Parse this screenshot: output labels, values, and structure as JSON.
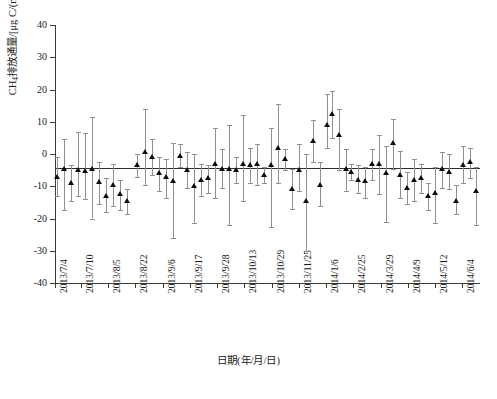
{
  "chart_data": {
    "type": "scatter",
    "title": "",
    "xlabel": "日期(年/月/日)",
    "ylabel": "CH4排放通量/[μg C/(m2 · h)]",
    "ylabel_parts": {
      "prefix": "CH",
      "sub1": "4",
      "mid": "排放通量/[μg C/(m",
      "sup1": "2",
      "suffix": " · h)]"
    },
    "ylim": [
      -40,
      40
    ],
    "yticks": [
      40,
      30,
      20,
      10,
      0,
      -10,
      -20,
      -30,
      -40
    ],
    "ytick_labels": [
      "40",
      "30",
      "20",
      "10",
      "0",
      "-10",
      "-20",
      "-30",
      "-40"
    ],
    "grid": false,
    "legend": "none",
    "marker_style": "filled-triangle",
    "error_bars": "vertical with caps",
    "reference_line": {
      "label": "mean flux",
      "value": -4.3,
      "orientation": "horizontal"
    },
    "xtick_labels": [
      "2013/7/4",
      "2013/7/10",
      "2013/8/5",
      "2013/8/22",
      "2013/9/6",
      "2013/9/17",
      "2013/9/28",
      "2013/10/13",
      "2013/10/29",
      "2013/11/25",
      "2014/1/6",
      "2014/2/25",
      "2014/3/29",
      "2014/4/9",
      "2014/5/12",
      "2014/6/4"
    ],
    "xtick_positions": [
      0,
      26,
      53,
      80,
      108,
      135,
      162,
      189,
      217,
      244,
      271,
      298,
      326,
      353,
      380,
      407
    ],
    "units": "μg C/(m2 · h)",
    "series": [
      {
        "name": "CH4 flux",
        "points": [
          {
            "x": 2,
            "y": -7.0,
            "lo": -13.0,
            "hi": -1.0
          },
          {
            "x": 9,
            "y": -4.6,
            "lo": -17.5,
            "hi": 4.5
          },
          {
            "x": 16,
            "y": -9.0,
            "lo": -14.5,
            "hi": -3.5
          },
          {
            "x": 23,
            "y": -5.0,
            "lo": -13.0,
            "hi": 6.8
          },
          {
            "x": 30,
            "y": -5.2,
            "lo": -14.0,
            "hi": 6.5
          },
          {
            "x": 37,
            "y": -4.5,
            "lo": -20.0,
            "hi": 11.5
          },
          {
            "x": 44,
            "y": -8.8,
            "lo": -15.5,
            "hi": -2.5
          },
          {
            "x": 51,
            "y": -13.0,
            "lo": -18.0,
            "hi": -7.5
          },
          {
            "x": 58,
            "y": -9.5,
            "lo": -16.0,
            "hi": -3.0
          },
          {
            "x": 65,
            "y": -12.5,
            "lo": -17.5,
            "hi": -8.0
          },
          {
            "x": 72,
            "y": -14.5,
            "lo": -18.5,
            "hi": -11.0
          },
          {
            "x": 82,
            "y": -3.5,
            "lo": -7.0,
            "hi": 0.0
          },
          {
            "x": 90,
            "y": 0.5,
            "lo": -9.5,
            "hi": 14.0
          },
          {
            "x": 97,
            "y": -1.0,
            "lo": -6.5,
            "hi": 4.5
          },
          {
            "x": 104,
            "y": -6.0,
            "lo": -11.5,
            "hi": -1.0
          },
          {
            "x": 111,
            "y": -7.0,
            "lo": -13.5,
            "hi": -1.5
          },
          {
            "x": 118,
            "y": -8.5,
            "lo": -26.0,
            "hi": 3.5
          },
          {
            "x": 125,
            "y": -0.5,
            "lo": -4.0,
            "hi": 3.0
          },
          {
            "x": 132,
            "y": -5.0,
            "lo": -10.5,
            "hi": 0.5
          },
          {
            "x": 139,
            "y": -10.0,
            "lo": -21.5,
            "hi": 0.0
          },
          {
            "x": 146,
            "y": -8.0,
            "lo": -13.0,
            "hi": -3.0
          },
          {
            "x": 153,
            "y": -7.5,
            "lo": -12.0,
            "hi": -3.5
          },
          {
            "x": 160,
            "y": -3.0,
            "lo": -13.5,
            "hi": 8.0
          },
          {
            "x": 167,
            "y": -4.5,
            "lo": -10.5,
            "hi": 1.5
          },
          {
            "x": 174,
            "y": -4.5,
            "lo": -22.0,
            "hi": 9.0
          },
          {
            "x": 181,
            "y": -5.0,
            "lo": -9.0,
            "hi": -1.0
          },
          {
            "x": 188,
            "y": -3.0,
            "lo": -14.5,
            "hi": 12.0
          },
          {
            "x": 195,
            "y": -3.5,
            "lo": -9.0,
            "hi": 2.0
          },
          {
            "x": 202,
            "y": -3.0,
            "lo": -9.5,
            "hi": 3.0
          },
          {
            "x": 209,
            "y": -6.5,
            "lo": -9.0,
            "hi": -4.0
          },
          {
            "x": 216,
            "y": -3.5,
            "lo": -22.5,
            "hi": 8.0
          },
          {
            "x": 223,
            "y": 2.0,
            "lo": -9.0,
            "hi": 15.5
          },
          {
            "x": 230,
            "y": -1.5,
            "lo": -5.0,
            "hi": 1.5
          },
          {
            "x": 237,
            "y": -11.0,
            "lo": -17.0,
            "hi": -4.5
          },
          {
            "x": 244,
            "y": -5.0,
            "lo": -11.5,
            "hi": 3.0
          },
          {
            "x": 251,
            "y": -14.5,
            "lo": -30.0,
            "hi": 0.0
          },
          {
            "x": 258,
            "y": 4.0,
            "lo": -2.5,
            "hi": 10.5
          },
          {
            "x": 265,
            "y": -9.5,
            "lo": -16.0,
            "hi": -2.5
          },
          {
            "x": 272,
            "y": 9.0,
            "lo": 2.0,
            "hi": 18.5
          },
          {
            "x": 277,
            "y": 12.5,
            "lo": 5.0,
            "hi": 19.5
          },
          {
            "x": 284,
            "y": 6.0,
            "lo": -5.0,
            "hi": 14.0
          },
          {
            "x": 291,
            "y": -4.5,
            "lo": -11.5,
            "hi": 1.5
          },
          {
            "x": 296,
            "y": -5.5,
            "lo": -8.0,
            "hi": -3.0
          },
          {
            "x": 303,
            "y": -8.0,
            "lo": -12.0,
            "hi": -3.5
          },
          {
            "x": 310,
            "y": -8.5,
            "lo": -13.5,
            "hi": -4.0
          },
          {
            "x": 317,
            "y": -3.0,
            "lo": -8.0,
            "hi": 1.5
          },
          {
            "x": 324,
            "y": -3.0,
            "lo": -12.5,
            "hi": 6.0
          },
          {
            "x": 331,
            "y": -6.0,
            "lo": -21.0,
            "hi": 2.5
          },
          {
            "x": 338,
            "y": 3.5,
            "lo": -4.5,
            "hi": 11.0
          },
          {
            "x": 345,
            "y": -6.5,
            "lo": -13.5,
            "hi": 1.0
          },
          {
            "x": 352,
            "y": -10.5,
            "lo": -15.5,
            "hi": -5.5
          },
          {
            "x": 359,
            "y": -8.0,
            "lo": -14.5,
            "hi": -1.5
          },
          {
            "x": 366,
            "y": -7.5,
            "lo": -12.0,
            "hi": -3.0
          },
          {
            "x": 373,
            "y": -13.0,
            "lo": -17.5,
            "hi": -9.0
          },
          {
            "x": 380,
            "y": -12.0,
            "lo": -21.5,
            "hi": -4.0
          },
          {
            "x": 387,
            "y": -4.5,
            "lo": -10.5,
            "hi": 0.5
          },
          {
            "x": 394,
            "y": -5.5,
            "lo": -11.0,
            "hi": 0.0
          },
          {
            "x": 401,
            "y": -14.5,
            "lo": -18.5,
            "hi": -9.5
          },
          {
            "x": 408,
            "y": -3.5,
            "lo": -9.0,
            "hi": 2.5
          },
          {
            "x": 415,
            "y": -2.5,
            "lo": -7.5,
            "hi": 2.0
          },
          {
            "x": 421,
            "y": -11.5,
            "lo": -22.0,
            "hi": -4.0
          }
        ]
      }
    ]
  },
  "caption": {
    "text": "",
    "visible": "clipped"
  }
}
